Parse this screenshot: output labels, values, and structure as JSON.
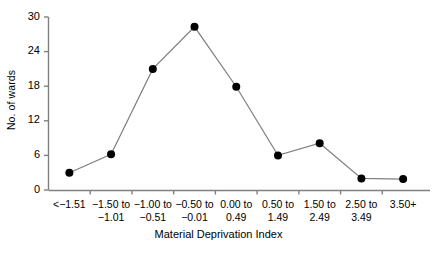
{
  "chart_data": {
    "type": "line",
    "title": "",
    "subtitle": "",
    "xlabel": "Material Deprivation Index",
    "ylabel": "No. of wards",
    "categories": [
      "<−1.51",
      "−1.50 to −1.01",
      "−1.00 to −0.51",
      "−0.50 to −0.01",
      "0.00 to 0.49",
      "0.50 to 1.49",
      "1.50 to 2.49",
      "2.50 to 3.49",
      "3.50+"
    ],
    "category_lines": [
      [
        "<−1.51",
        ""
      ],
      [
        "−1.50 to",
        "−1.01"
      ],
      [
        "−1.00 to",
        "−0.51"
      ],
      [
        "−0.50 to",
        "−0.01"
      ],
      [
        "0.00 to",
        "0.49"
      ],
      [
        "0.50 to",
        "1.49"
      ],
      [
        "1.50 to",
        "2.49"
      ],
      [
        "2.50 to",
        "3.49"
      ],
      [
        "3.50+",
        ""
      ]
    ],
    "values": [
      3,
      6.2,
      21,
      28.3,
      17.9,
      6,
      8.1,
      2,
      1.9
    ],
    "series": [
      {
        "name": "No. of wards",
        "values": [
          3,
          6.2,
          21,
          28.3,
          17.9,
          6,
          8.1,
          2,
          1.9
        ]
      }
    ],
    "ylim": [
      0,
      30
    ],
    "yticks": [
      0,
      6,
      12,
      18,
      24,
      30
    ],
    "ytick_labels": [
      "0",
      "6",
      "12",
      "18",
      "24",
      "30"
    ],
    "grid": false,
    "legend": false,
    "legend_position": "none",
    "marker": "filled-circle",
    "marker_color": "#000000",
    "line_color": "#808080",
    "axis_color": "#808080",
    "background": "#ffffff"
  }
}
